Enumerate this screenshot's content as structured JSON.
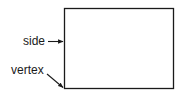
{
  "diagram": {
    "shape": "rectangle",
    "labels": {
      "side": "side",
      "vertex": "vertex"
    },
    "colors": {
      "stroke": "#1a1a1a",
      "background": "#ffffff"
    }
  }
}
